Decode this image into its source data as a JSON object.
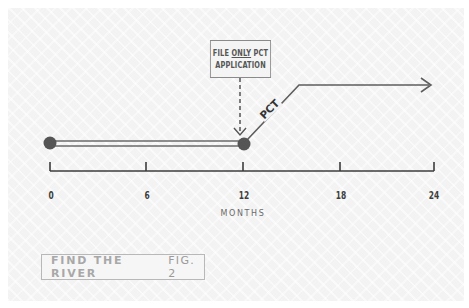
{
  "diagram": {
    "type": "timeline",
    "callout": {
      "line1_prefix": "FILE ",
      "line1_emphasis": "ONLY",
      "line1_suffix": " PCT",
      "line2": "APPLICATION",
      "points_to_month": 12
    },
    "segments": [
      {
        "from_month": 0,
        "to_month": 12,
        "style": "double-line",
        "label": ""
      },
      {
        "from_month": 12,
        "to_month": 24,
        "style": "arrow",
        "label": "PCT"
      }
    ],
    "markers": [
      {
        "month": 0,
        "shape": "filled-circle"
      },
      {
        "month": 12,
        "shape": "filled-circle"
      }
    ],
    "axis": {
      "title": "MONTHS",
      "ticks": [
        "0",
        "6",
        "12",
        "18",
        "24"
      ],
      "range": [
        0,
        24
      ]
    },
    "caption": {
      "title": "FIND THE RIVER",
      "figure": "FIG. 2"
    },
    "colors": {
      "line": "#5a5a5a",
      "marker": "#555555",
      "axis": "#3c3c3c",
      "caption_text": "#a8a8a8",
      "background": "#f3f3f3"
    }
  }
}
